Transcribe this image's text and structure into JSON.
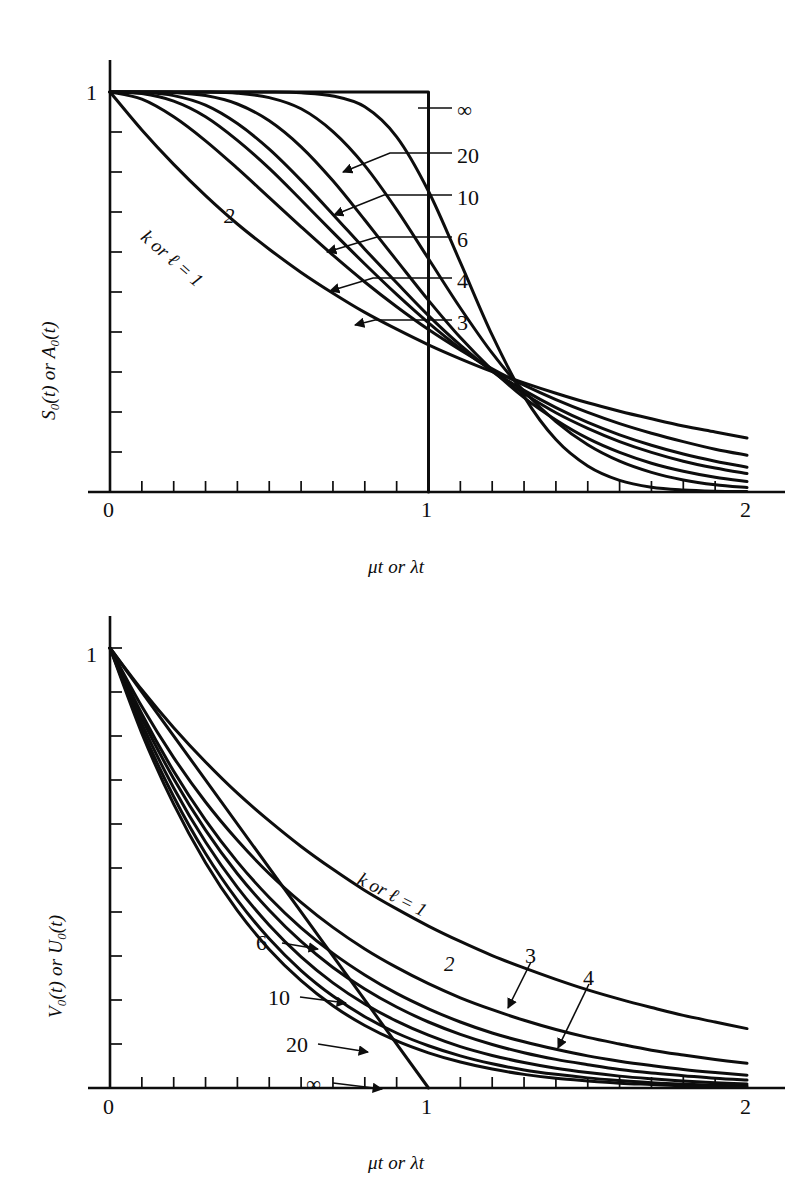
{
  "figure": {
    "background": "#ffffff",
    "ink": "#0d0d0d",
    "panels": [
      "top",
      "bottom"
    ]
  },
  "panels": {
    "top": {
      "ylabel_parts": {
        "a": "S",
        "a_sub": "0",
        "a_arg": "(t)",
        "conj": " or ",
        "b": "A",
        "b_sub": "0",
        "b_arg": "(t)"
      },
      "ylabel_plain": "S0(t) or A0(t)",
      "xlabel": "μt or λt",
      "xticks": [
        "0",
        "1",
        "2"
      ],
      "yticks": [
        "0",
        "1"
      ],
      "leader_labels": [
        "∞",
        "20",
        "10",
        "6",
        "4",
        "3"
      ],
      "inline_labels": [
        "2"
      ],
      "rot_label": "k or ℓ = 1"
    },
    "bottom": {
      "ylabel_parts": {
        "a": "V",
        "a_sub": "0",
        "a_arg": "(t)",
        "conj": " or ",
        "b": "U",
        "b_sub": "0",
        "b_arg": "(t)"
      },
      "ylabel_plain": "V0(t) or U0(t)",
      "xlabel": "μt or λt",
      "xticks": [
        "0",
        "1",
        "2"
      ],
      "yticks": [
        "0",
        "1"
      ],
      "leader_labels": [
        "6",
        "10",
        "20",
        "∞",
        "3",
        "4"
      ],
      "inline_labels": [
        "2"
      ],
      "rot_label": "k or ℓ = 1"
    }
  },
  "chart_data": [
    {
      "id": "top",
      "type": "line",
      "title": "",
      "xlabel": "μt or λt",
      "ylabel": "S₀(t) or A₀(t)",
      "xlim": [
        0,
        2
      ],
      "ylim": [
        0,
        1
      ],
      "xticks": [
        0,
        1,
        2
      ],
      "yticks": [
        0,
        1
      ],
      "minor_tick_step": 0.1,
      "grid": false,
      "legend": "inline-leader-lines",
      "x": [
        0.0,
        0.1,
        0.2,
        0.3,
        0.4,
        0.5,
        0.6,
        0.7,
        0.8,
        0.9,
        1.0,
        1.1,
        1.2,
        1.3,
        1.4,
        1.5,
        1.6,
        1.7,
        1.8,
        1.9,
        2.0
      ],
      "series": [
        {
          "name": "k or ℓ = 1",
          "k": 1,
          "values": [
            1.0,
            0.905,
            0.819,
            0.741,
            0.67,
            0.607,
            0.549,
            0.497,
            0.449,
            0.407,
            0.368,
            0.333,
            0.301,
            0.273,
            0.247,
            0.223,
            0.202,
            0.183,
            0.165,
            0.15,
            0.135
          ]
        },
        {
          "name": "2",
          "k": 2,
          "values": [
            1.0,
            0.982,
            0.938,
            0.878,
            0.809,
            0.736,
            0.663,
            0.592,
            0.525,
            0.463,
            0.406,
            0.355,
            0.308,
            0.267,
            0.231,
            0.199,
            0.171,
            0.147,
            0.126,
            0.107,
            0.092
          ]
        },
        {
          "name": "3",
          "k": 3,
          "values": [
            1.0,
            0.996,
            0.977,
            0.938,
            0.879,
            0.809,
            0.73,
            0.649,
            0.57,
            0.494,
            0.423,
            0.359,
            0.303,
            0.254,
            0.211,
            0.174,
            0.143,
            0.117,
            0.095,
            0.077,
            0.062
          ]
        },
        {
          "name": "4",
          "k": 4,
          "values": [
            1.0,
            0.999,
            0.991,
            0.967,
            0.921,
            0.857,
            0.779,
            0.694,
            0.607,
            0.523,
            0.441,
            0.367,
            0.302,
            0.246,
            0.198,
            0.159,
            0.126,
            0.099,
            0.077,
            0.06,
            0.046
          ]
        },
        {
          "name": "6",
          "k": 6,
          "values": [
            1.0,
            1.0,
            0.999,
            0.991,
            0.97,
            0.928,
            0.863,
            0.778,
            0.68,
            0.579,
            0.479,
            0.386,
            0.305,
            0.236,
            0.18,
            0.134,
            0.099,
            0.072,
            0.052,
            0.037,
            0.026
          ]
        },
        {
          "name": "10",
          "k": 10,
          "values": [
            1.0,
            1.0,
            1.0,
            1.0,
            0.997,
            0.986,
            0.958,
            0.901,
            0.816,
            0.706,
            0.583,
            0.46,
            0.347,
            0.252,
            0.176,
            0.118,
            0.077,
            0.049,
            0.03,
            0.018,
            0.011
          ]
        },
        {
          "name": "20",
          "k": 20,
          "values": [
            1.0,
            1.0,
            1.0,
            1.0,
            1.0,
            1.0,
            0.998,
            0.99,
            0.963,
            0.888,
            0.752,
            0.574,
            0.392,
            0.239,
            0.131,
            0.065,
            0.029,
            0.012,
            0.005,
            0.002,
            0.001
          ]
        },
        {
          "name": "∞",
          "k": "inf",
          "shape": "step",
          "values": [
            1.0,
            1.0,
            1.0,
            1.0,
            1.0,
            1.0,
            1.0,
            1.0,
            1.0,
            1.0,
            1.0,
            0.0,
            0.0,
            0.0,
            0.0,
            0.0,
            0.0,
            0.0,
            0.0,
            0.0,
            0.0
          ]
        }
      ],
      "annotations": [
        {
          "text": "∞",
          "target_series": "∞"
        },
        {
          "text": "20",
          "target_series": "20"
        },
        {
          "text": "10",
          "target_series": "10"
        },
        {
          "text": "6",
          "target_series": "6"
        },
        {
          "text": "4",
          "target_series": "4"
        },
        {
          "text": "3",
          "target_series": "3"
        },
        {
          "text": "2",
          "target_series": "2"
        },
        {
          "text": "k or ℓ = 1",
          "target_series": "k or ℓ = 1"
        }
      ]
    },
    {
      "id": "bottom",
      "type": "line",
      "title": "",
      "xlabel": "μt or λt",
      "ylabel": "V₀(t) or U₀(t)",
      "xlim": [
        0,
        2
      ],
      "ylim": [
        0,
        1
      ],
      "xticks": [
        0,
        1,
        2
      ],
      "yticks": [
        0,
        1
      ],
      "minor_tick_step": 0.1,
      "grid": false,
      "legend": "inline-leader-lines",
      "x": [
        0.0,
        0.1,
        0.2,
        0.3,
        0.4,
        0.5,
        0.6,
        0.7,
        0.8,
        0.9,
        1.0,
        1.1,
        1.2,
        1.3,
        1.4,
        1.5,
        1.6,
        1.7,
        1.8,
        1.9,
        2.0
      ],
      "series": [
        {
          "name": "k or ℓ = 1",
          "k": 1,
          "values": [
            1.0,
            0.905,
            0.819,
            0.741,
            0.67,
            0.607,
            0.549,
            0.497,
            0.449,
            0.407,
            0.368,
            0.333,
            0.301,
            0.273,
            0.247,
            0.223,
            0.202,
            0.183,
            0.165,
            0.15,
            0.135
          ]
        },
        {
          "name": "2",
          "k": 2,
          "values": [
            1.0,
            0.867,
            0.751,
            0.65,
            0.563,
            0.487,
            0.422,
            0.365,
            0.316,
            0.274,
            0.237,
            0.205,
            0.178,
            0.154,
            0.133,
            0.115,
            0.1,
            0.086,
            0.075,
            0.065,
            0.056
          ]
        },
        {
          "name": "3",
          "k": 3,
          "values": [
            1.0,
            0.85,
            0.72,
            0.609,
            0.514,
            0.433,
            0.364,
            0.306,
            0.257,
            0.215,
            0.18,
            0.15,
            0.125,
            0.105,
            0.088,
            0.073,
            0.061,
            0.051,
            0.042,
            0.035,
            0.029
          ]
        },
        {
          "name": "4",
          "k": 4,
          "values": [
            1.0,
            0.84,
            0.703,
            0.586,
            0.487,
            0.404,
            0.333,
            0.274,
            0.225,
            0.184,
            0.15,
            0.122,
            0.099,
            0.08,
            0.065,
            0.053,
            0.042,
            0.034,
            0.028,
            0.022,
            0.018
          ]
        },
        {
          "name": "6",
          "k": 6,
          "values": [
            1.0,
            0.828,
            0.682,
            0.559,
            0.456,
            0.37,
            0.298,
            0.239,
            0.191,
            0.152,
            0.12,
            0.094,
            0.074,
            0.058,
            0.045,
            0.035,
            0.027,
            0.021,
            0.016,
            0.012,
            0.009
          ]
        },
        {
          "name": "10",
          "k": 10,
          "values": [
            1.0,
            0.816,
            0.662,
            0.533,
            0.427,
            0.339,
            0.267,
            0.209,
            0.162,
            0.125,
            0.096,
            0.073,
            0.055,
            0.041,
            0.031,
            0.023,
            0.017,
            0.012,
            0.009,
            0.006,
            0.005
          ]
        },
        {
          "name": "20",
          "k": 20,
          "values": [
            1.0,
            0.806,
            0.645,
            0.512,
            0.403,
            0.315,
            0.244,
            0.187,
            0.142,
            0.107,
            0.08,
            0.059,
            0.043,
            0.031,
            0.022,
            0.016,
            0.011,
            0.008,
            0.005,
            0.004,
            0.003
          ]
        },
        {
          "name": "∞",
          "k": "inf",
          "shape": "linear-to-zero",
          "values": [
            1.0,
            0.9,
            0.8,
            0.7,
            0.6,
            0.5,
            0.4,
            0.3,
            0.2,
            0.1,
            0.0,
            0.0,
            0.0,
            0.0,
            0.0,
            0.0,
            0.0,
            0.0,
            0.0,
            0.0,
            0.0
          ]
        }
      ],
      "annotations": [
        {
          "text": "k or ℓ = 1",
          "target_series": "k or ℓ = 1"
        },
        {
          "text": "2",
          "target_series": "2"
        },
        {
          "text": "3",
          "target_series": "3"
        },
        {
          "text": "4",
          "target_series": "4"
        },
        {
          "text": "6",
          "target_series": "6"
        },
        {
          "text": "10",
          "target_series": "10"
        },
        {
          "text": "20",
          "target_series": "20"
        },
        {
          "text": "∞",
          "target_series": "∞"
        }
      ]
    }
  ]
}
